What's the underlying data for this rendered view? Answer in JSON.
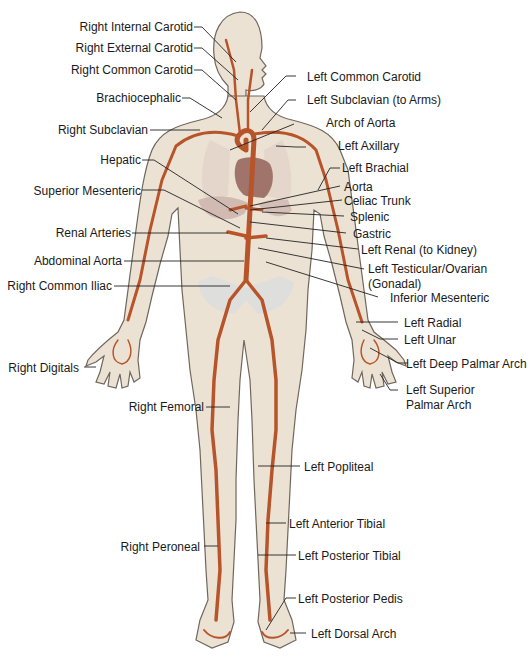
{
  "colors": {
    "skin": "#ece2d4",
    "skin_outline": "#6f665c",
    "artery": "#b8542a",
    "organ": "#a0746a",
    "bone": "#d8dde0",
    "leader": "#222222"
  },
  "labels_right_side_of_body": [
    "Right Internal Carotid",
    "Right External Carotid",
    "Right Common Carotid",
    "Brachiocephalic",
    "Right Subclavian",
    "Hepatic",
    "Superior Mesenteric",
    "Renal Arteries",
    "Abdominal Aorta",
    "Right Common Iliac",
    "Right Digitals",
    "Right Femoral",
    "Right Peroneal"
  ],
  "labels_left_side_of_body": [
    "Left Common Carotid",
    "Left Subclavian (to Arms)",
    "Arch of Aorta",
    "Left Axillary",
    "Left Brachial",
    "Aorta",
    "Celiac Trunk",
    "Splenic",
    "Gastric",
    "Left Renal (to Kidney)",
    "Left Testicular/Ovarian",
    "(Gonadal)",
    "Inferior Mesenteric",
    "Left Radial",
    "Left Ulnar",
    "Left Deep Palmar Arch",
    "Left Superior",
    "Palmar Arch",
    "Left Popliteal",
    "Left Anterior Tibial",
    "Left Posterior Tibial",
    "Left Posterior Pedis",
    "Left Dorsal Arch"
  ]
}
